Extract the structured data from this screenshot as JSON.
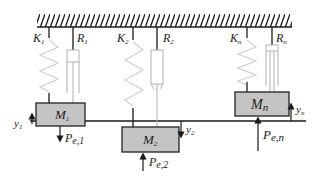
{
  "diagram": {
    "ceiling": {
      "label": "fixed support"
    },
    "units": [
      {
        "spring_label": "K",
        "spring_sub": "1",
        "damper_label": "R",
        "damper_sub": "1",
        "mass_label": "M",
        "mass_sub": "1",
        "disp_label": "y",
        "disp_sub": "1",
        "disp_dir": "up",
        "force_label": "P",
        "force_sub": "e,1",
        "force_dir": "down"
      },
      {
        "spring_label": "K",
        "spring_sub": "2",
        "damper_label": "R",
        "damper_sub": "2",
        "mass_label": "M",
        "mass_sub": "2",
        "disp_label": "y",
        "disp_sub": "2",
        "disp_dir": "down",
        "force_label": "P",
        "force_sub": "e,2",
        "force_dir": "up"
      },
      {
        "spring_label": "K",
        "spring_sub": "n",
        "damper_label": "R",
        "damper_sub": "n",
        "mass_label": "M",
        "mass_sub": "n",
        "disp_label": "y",
        "disp_sub": "n",
        "disp_dir": "up",
        "force_label": "P",
        "force_sub": "e,n",
        "force_dir": "up"
      }
    ],
    "colors": {
      "line": "#1a1a1a",
      "spring": "#c8c8c8",
      "damper": "#b0b0b0",
      "mass_fill": "#c4c4c4",
      "mass_stroke": "#222222"
    }
  }
}
